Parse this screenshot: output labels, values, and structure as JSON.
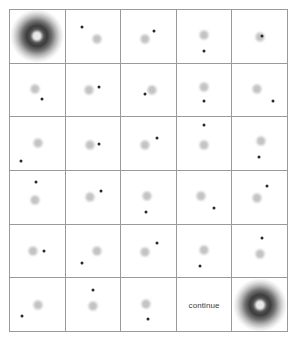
{
  "screen": {
    "title": "visual-search-grid",
    "background_color": "#ffffff",
    "grid_line_color": "#9a9a9a",
    "target_color": "#b9b9b9",
    "probe_color": "#2a2a2a",
    "glow_color": "#3c3c3c"
  },
  "grid": {
    "columns": 5,
    "rows": 6,
    "cells": [
      {
        "id": "r1c1",
        "row": 1,
        "col": 1,
        "type": "glow",
        "label": ""
      },
      {
        "id": "r1c2",
        "row": 1,
        "col": 2,
        "type": "dots",
        "label": "",
        "target": {
          "x": 57,
          "y": 56
        },
        "probe": {
          "x": 30,
          "y": 32
        }
      },
      {
        "id": "r1c3",
        "row": 1,
        "col": 3,
        "type": "dots",
        "label": "",
        "target": {
          "x": 43,
          "y": 56
        },
        "probe": {
          "x": 60,
          "y": 40
        }
      },
      {
        "id": "r1c4",
        "row": 1,
        "col": 4,
        "type": "dots",
        "label": "",
        "target": {
          "x": 50,
          "y": 48
        },
        "probe": {
          "x": 50,
          "y": 78
        }
      },
      {
        "id": "r1c5",
        "row": 1,
        "col": 5,
        "type": "dots",
        "label": "",
        "target": {
          "x": 50,
          "y": 52
        },
        "probe": {
          "x": 55,
          "y": 50
        }
      },
      {
        "id": "r2c1",
        "row": 2,
        "col": 1,
        "type": "dots",
        "label": "",
        "target": {
          "x": 45,
          "y": 48
        },
        "probe": {
          "x": 58,
          "y": 68
        }
      },
      {
        "id": "r2c2",
        "row": 2,
        "col": 2,
        "type": "dots",
        "label": "",
        "target": {
          "x": 43,
          "y": 50
        },
        "probe": {
          "x": 62,
          "y": 45
        }
      },
      {
        "id": "r2c3",
        "row": 2,
        "col": 3,
        "type": "dots",
        "label": "",
        "target": {
          "x": 57,
          "y": 50
        },
        "probe": {
          "x": 44,
          "y": 57
        }
      },
      {
        "id": "r2c4",
        "row": 2,
        "col": 4,
        "type": "dots",
        "label": "",
        "target": {
          "x": 50,
          "y": 45
        },
        "probe": {
          "x": 50,
          "y": 70
        }
      },
      {
        "id": "r2c5",
        "row": 2,
        "col": 5,
        "type": "dots",
        "label": "",
        "target": {
          "x": 45,
          "y": 48
        },
        "probe": {
          "x": 74,
          "y": 70
        }
      },
      {
        "id": "r3c1",
        "row": 3,
        "col": 1,
        "type": "dots",
        "label": "",
        "target": {
          "x": 52,
          "y": 48
        },
        "probe": {
          "x": 20,
          "y": 82
        }
      },
      {
        "id": "r3c2",
        "row": 3,
        "col": 2,
        "type": "dots",
        "label": "",
        "target": {
          "x": 45,
          "y": 52
        },
        "probe": {
          "x": 62,
          "y": 50
        }
      },
      {
        "id": "r3c3",
        "row": 3,
        "col": 3,
        "type": "dots",
        "label": "",
        "target": {
          "x": 43,
          "y": 52
        },
        "probe": {
          "x": 66,
          "y": 40
        }
      },
      {
        "id": "r3c4",
        "row": 3,
        "col": 4,
        "type": "dots",
        "label": "",
        "target": {
          "x": 50,
          "y": 52
        },
        "probe": {
          "x": 50,
          "y": 14
        }
      },
      {
        "id": "r3c5",
        "row": 3,
        "col": 5,
        "type": "dots",
        "label": "",
        "target": {
          "x": 52,
          "y": 45
        },
        "probe": {
          "x": 48,
          "y": 75
        }
      },
      {
        "id": "r4c1",
        "row": 4,
        "col": 1,
        "type": "dots",
        "label": "",
        "target": {
          "x": 45,
          "y": 55
        },
        "probe": {
          "x": 47,
          "y": 20
        }
      },
      {
        "id": "r4c2",
        "row": 4,
        "col": 2,
        "type": "dots",
        "label": "",
        "target": {
          "x": 45,
          "y": 50
        },
        "probe": {
          "x": 64,
          "y": 38
        }
      },
      {
        "id": "r4c3",
        "row": 4,
        "col": 3,
        "type": "dots",
        "label": "",
        "target": {
          "x": 47,
          "y": 48
        },
        "probe": {
          "x": 45,
          "y": 78
        }
      },
      {
        "id": "r4c4",
        "row": 4,
        "col": 4,
        "type": "dots",
        "label": "",
        "target": {
          "x": 45,
          "y": 48
        },
        "probe": {
          "x": 68,
          "y": 70
        }
      },
      {
        "id": "r4c5",
        "row": 4,
        "col": 5,
        "type": "dots",
        "label": "",
        "target": {
          "x": 45,
          "y": 52
        },
        "probe": {
          "x": 64,
          "y": 28
        }
      },
      {
        "id": "r5c1",
        "row": 5,
        "col": 1,
        "type": "dots",
        "label": "",
        "target": {
          "x": 43,
          "y": 50
        },
        "probe": {
          "x": 62,
          "y": 50
        }
      },
      {
        "id": "r5c2",
        "row": 5,
        "col": 2,
        "type": "dots",
        "label": "",
        "target": {
          "x": 57,
          "y": 50
        },
        "probe": {
          "x": 30,
          "y": 72
        }
      },
      {
        "id": "r5c3",
        "row": 5,
        "col": 3,
        "type": "dots",
        "label": "",
        "target": {
          "x": 43,
          "y": 52
        },
        "probe": {
          "x": 66,
          "y": 35
        }
      },
      {
        "id": "r5c4",
        "row": 5,
        "col": 4,
        "type": "dots",
        "label": "",
        "target": {
          "x": 50,
          "y": 48
        },
        "probe": {
          "x": 42,
          "y": 78
        }
      },
      {
        "id": "r5c5",
        "row": 5,
        "col": 5,
        "type": "dots",
        "label": "",
        "target": {
          "x": 50,
          "y": 55
        },
        "probe": {
          "x": 54,
          "y": 26
        }
      },
      {
        "id": "r6c1",
        "row": 6,
        "col": 1,
        "type": "dots",
        "label": "",
        "target": {
          "x": 52,
          "y": 50
        },
        "probe": {
          "x": 22,
          "y": 72
        }
      },
      {
        "id": "r6c2",
        "row": 6,
        "col": 2,
        "type": "dots",
        "label": "",
        "target": {
          "x": 50,
          "y": 52
        },
        "probe": {
          "x": 50,
          "y": 22
        }
      },
      {
        "id": "r6c3",
        "row": 6,
        "col": 3,
        "type": "dots",
        "label": "",
        "target": {
          "x": 45,
          "y": 48
        },
        "probe": {
          "x": 50,
          "y": 78
        }
      },
      {
        "id": "r6c4",
        "row": 6,
        "col": 4,
        "type": "text",
        "label": "continue"
      },
      {
        "id": "r6c5",
        "row": 6,
        "col": 5,
        "type": "glow",
        "label": ""
      }
    ]
  }
}
